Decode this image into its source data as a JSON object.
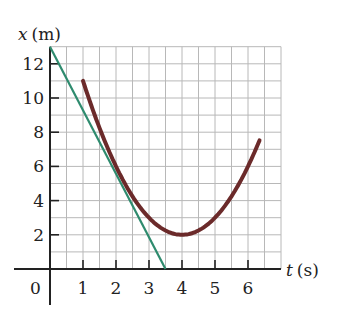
{
  "chart_data": {
    "type": "line",
    "title": "",
    "xlabel_var": "t",
    "xlabel_unit": "(s)",
    "ylabel_var": "x",
    "ylabel_unit": "(m)",
    "xlim": [
      0,
      7
    ],
    "ylim": [
      0,
      13
    ],
    "grid": true,
    "grid_x_step": 0.5,
    "grid_y_step": 1,
    "x_ticks": [
      1,
      2,
      3,
      4,
      5,
      6
    ],
    "y_ticks": [
      2,
      4,
      6,
      8,
      10,
      12
    ],
    "origin_label": "0",
    "series": [
      {
        "name": "position curve",
        "color": "#6b2a2a",
        "kind": "parabola",
        "equation": "x = 2 + (t - 4)^2",
        "t_range": [
          1,
          6.35
        ],
        "points": [
          [
            1,
            11
          ],
          [
            2,
            6
          ],
          [
            3,
            3
          ],
          [
            4,
            2
          ],
          [
            5,
            3
          ],
          [
            6,
            6
          ],
          [
            6.35,
            7.5
          ]
        ]
      },
      {
        "name": "tangent line",
        "color": "#2e8b6e",
        "kind": "line",
        "points": [
          [
            0,
            13
          ],
          [
            3.5,
            0
          ]
        ]
      }
    ]
  }
}
